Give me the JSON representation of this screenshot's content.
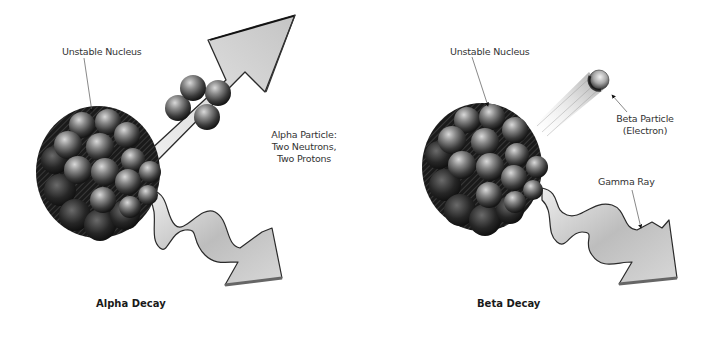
{
  "alpha": {
    "nucleus_label": "Unstable Nucleus",
    "particle_label_line1": "Alpha Particle:",
    "particle_label_line2": "Two Neutrons,",
    "particle_label_line3": "Two Protons",
    "caption": "Alpha Decay"
  },
  "beta": {
    "nucleus_label": "Unstable Nucleus",
    "particle_label_line1": "Beta Particle",
    "particle_label_line2": "(Electron)",
    "gamma_label": "Gamma Ray",
    "caption": "Beta Decay"
  },
  "colors": {
    "background": "#ffffff",
    "sphere_light": "#b8b8b8",
    "sphere_mid": "#6e6e6e",
    "sphere_dark": "#1e1e1e",
    "arrow_fill": "#d4d4d4",
    "arrow_stroke": "#2a2a2a",
    "text": "#333333"
  }
}
